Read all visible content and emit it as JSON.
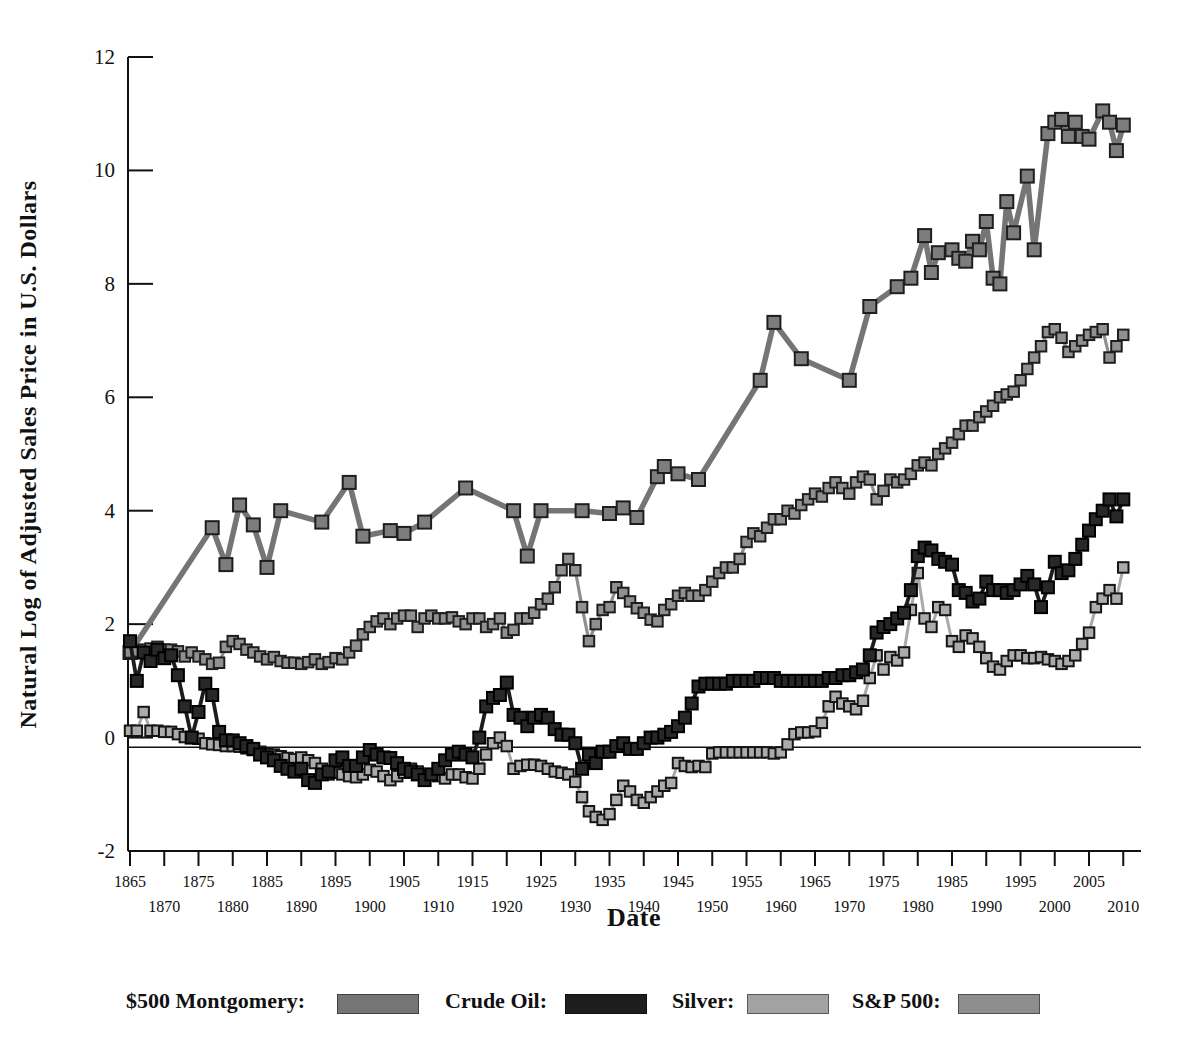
{
  "figure": {
    "y_axis": {
      "title": "Natural Log of Adjusted Sales Price in U.S. Dollars",
      "ticks": [
        12,
        10,
        8,
        6,
        4,
        2,
        0,
        -2
      ],
      "min": -2,
      "max": 12
    },
    "x_axis": {
      "title": "Date",
      "tick_years": [
        1865,
        1870,
        1875,
        1880,
        1885,
        1890,
        1895,
        1900,
        1905,
        1910,
        1915,
        1920,
        1925,
        1930,
        1935,
        1940,
        1945,
        1950,
        1955,
        1960,
        1965,
        1970,
        1975,
        1980,
        1985,
        1990,
        1995,
        2000,
        2005,
        2010
      ],
      "min": 1865,
      "max": 2010
    },
    "baseline_value": -0.17
  },
  "legend": {
    "items": [
      {
        "label": "$500 Montgomery:",
        "color": "#757575"
      },
      {
        "label": "Crude Oil:",
        "color": "#1d1d1d"
      },
      {
        "label": "Silver:",
        "color": "#a2a2a2"
      },
      {
        "label": "S&P 500:",
        "color": "#8e8e8e"
      }
    ]
  },
  "chart_data": {
    "type": "line",
    "title": "",
    "xlabel": "Date",
    "ylabel": "Natural Log of Adjusted Sales Price in U.S. Dollars",
    "xlim": [
      1863,
      2012
    ],
    "ylim": [
      -2,
      12
    ],
    "grid": false,
    "legend_position": "bottom",
    "series": [
      {
        "name": "$500 Montgomery",
        "line_color": "#757575",
        "marker_fill": "#7d7d7d",
        "marker_edge": "#1e1e1e",
        "line_width": 5.5,
        "marker_size": 13,
        "points": [
          [
            1865,
            1.5
          ],
          [
            1877,
            3.7
          ],
          [
            1879,
            3.05
          ],
          [
            1881,
            4.1
          ],
          [
            1883,
            3.75
          ],
          [
            1885,
            3.0
          ],
          [
            1887,
            4.0
          ],
          [
            1893,
            3.8
          ],
          [
            1897,
            4.5
          ],
          [
            1899,
            3.55
          ],
          [
            1903,
            3.65
          ],
          [
            1905,
            3.6
          ],
          [
            1908,
            3.8
          ],
          [
            1914,
            4.4
          ],
          [
            1921,
            4.0
          ],
          [
            1923,
            3.2
          ],
          [
            1925,
            4.0
          ],
          [
            1931,
            4.0
          ],
          [
            1935,
            3.95
          ],
          [
            1937,
            4.05
          ],
          [
            1939,
            3.88
          ],
          [
            1942,
            4.6
          ],
          [
            1943,
            4.78
          ],
          [
            1945,
            4.65
          ],
          [
            1948,
            4.55
          ],
          [
            1957,
            6.3
          ],
          [
            1959,
            7.32
          ],
          [
            1963,
            6.68
          ],
          [
            1970,
            6.3
          ],
          [
            1973,
            7.6
          ],
          [
            1977,
            7.95
          ],
          [
            1979,
            8.1
          ],
          [
            1981,
            8.85
          ],
          [
            1982,
            8.2
          ],
          [
            1983,
            8.55
          ],
          [
            1985,
            8.6
          ],
          [
            1986,
            8.45
          ],
          [
            1987,
            8.4
          ],
          [
            1988,
            8.75
          ],
          [
            1989,
            8.6
          ],
          [
            1990,
            9.1
          ],
          [
            1991,
            8.1
          ],
          [
            1992,
            8.0
          ],
          [
            1993,
            9.45
          ],
          [
            1994,
            8.9
          ],
          [
            1996,
            9.9
          ],
          [
            1997,
            8.6
          ],
          [
            1999,
            10.65
          ],
          [
            2000,
            10.85
          ],
          [
            2001,
            10.9
          ],
          [
            2002,
            10.6
          ],
          [
            2003,
            10.85
          ],
          [
            2004,
            10.6
          ],
          [
            2005,
            10.55
          ],
          [
            2007,
            11.05
          ],
          [
            2008,
            10.85
          ],
          [
            2009,
            10.35
          ],
          [
            2010,
            10.8
          ]
        ]
      },
      {
        "name": "S&P 500",
        "line_color": "#8f8f8f",
        "marker_fill": "#909090",
        "marker_edge": "#1e1e1e",
        "line_width": 3.2,
        "marker_size": 10.5,
        "start_year": 1865,
        "values": [
          1.5,
          1.52,
          1.55,
          1.57,
          1.6,
          1.55,
          1.55,
          1.52,
          1.43,
          1.5,
          1.43,
          1.38,
          1.3,
          1.32,
          1.6,
          1.7,
          1.65,
          1.55,
          1.5,
          1.43,
          1.38,
          1.42,
          1.35,
          1.32,
          1.32,
          1.3,
          1.33,
          1.38,
          1.3,
          1.33,
          1.4,
          1.38,
          1.5,
          1.62,
          1.82,
          1.95,
          2.05,
          2.1,
          2.0,
          2.1,
          2.15,
          2.15,
          1.95,
          2.1,
          2.15,
          2.1,
          2.1,
          2.12,
          2.05,
          2.0,
          2.1,
          2.1,
          1.95,
          2.0,
          2.1,
          1.85,
          1.9,
          2.1,
          2.1,
          2.2,
          2.35,
          2.45,
          2.65,
          2.95,
          3.15,
          2.95,
          2.3,
          1.7,
          2.0,
          2.25,
          2.3,
          2.65,
          2.55,
          2.4,
          2.28,
          2.2,
          2.08,
          2.05,
          2.25,
          2.35,
          2.5,
          2.55,
          2.5,
          2.5,
          2.6,
          2.75,
          2.9,
          3.0,
          3.0,
          3.15,
          3.45,
          3.6,
          3.55,
          3.7,
          3.85,
          3.85,
          4.0,
          3.95,
          4.1,
          4.2,
          4.3,
          4.25,
          4.4,
          4.5,
          4.4,
          4.3,
          4.5,
          4.6,
          4.55,
          4.2,
          4.35,
          4.55,
          4.5,
          4.55,
          4.65,
          4.8,
          4.85,
          4.8,
          5.0,
          5.1,
          5.2,
          5.35,
          5.5,
          5.5,
          5.65,
          5.75,
          5.85,
          6.0,
          6.05,
          6.1,
          6.3,
          6.5,
          6.7,
          6.9,
          7.15,
          7.2,
          7.05,
          6.8,
          6.9,
          7.0,
          7.1,
          7.15,
          7.2,
          6.7,
          6.9,
          7.1
        ]
      },
      {
        "name": "Silver",
        "line_color": "#a9a9a9",
        "marker_fill": "#ababab",
        "marker_edge": "#151515",
        "line_width": 3,
        "marker_size": 10.5,
        "start_year": 1865,
        "values": [
          0.12,
          0.12,
          0.45,
          0.12,
          0.12,
          0.1,
          0.1,
          0.06,
          0.01,
          0.0,
          -0.02,
          -0.1,
          -0.12,
          -0.13,
          -0.15,
          -0.15,
          -0.16,
          -0.19,
          -0.22,
          -0.25,
          -0.28,
          -0.3,
          -0.33,
          -0.36,
          -0.38,
          -0.35,
          -0.4,
          -0.45,
          -0.55,
          -0.65,
          -0.62,
          -0.65,
          -0.68,
          -0.7,
          -0.65,
          -0.57,
          -0.6,
          -0.68,
          -0.75,
          -0.68,
          -0.62,
          -0.55,
          -0.6,
          -0.68,
          -0.65,
          -0.68,
          -0.72,
          -0.65,
          -0.65,
          -0.7,
          -0.72,
          -0.55,
          -0.3,
          -0.1,
          0.0,
          -0.15,
          -0.55,
          -0.5,
          -0.48,
          -0.48,
          -0.5,
          -0.55,
          -0.6,
          -0.62,
          -0.65,
          -0.78,
          -1.05,
          -1.3,
          -1.4,
          -1.45,
          -1.35,
          -1.1,
          -0.85,
          -0.95,
          -1.1,
          -1.15,
          -1.05,
          -0.95,
          -0.85,
          -0.8,
          -0.45,
          -0.5,
          -0.52,
          -0.5,
          -0.52,
          -0.28,
          -0.26,
          -0.26,
          -0.26,
          -0.26,
          -0.26,
          -0.26,
          -0.26,
          -0.26,
          -0.28,
          -0.26,
          -0.12,
          0.06,
          0.09,
          0.09,
          0.11,
          0.26,
          0.55,
          0.72,
          0.6,
          0.55,
          0.5,
          0.65,
          1.05,
          1.45,
          1.2,
          1.42,
          1.36,
          1.5,
          2.25,
          2.9,
          2.1,
          1.95,
          2.3,
          2.25,
          1.7,
          1.6,
          1.8,
          1.75,
          1.6,
          1.4,
          1.25,
          1.2,
          1.35,
          1.45,
          1.45,
          1.4,
          1.4,
          1.42,
          1.38,
          1.35,
          1.3,
          1.35,
          1.45,
          1.65,
          1.85,
          2.3,
          2.45,
          2.6,
          2.45,
          3.0
        ]
      },
      {
        "name": "Crude Oil",
        "line_color": "#1c1c1c",
        "marker_fill": "#282828",
        "marker_edge": "#000000",
        "line_width": 3.8,
        "marker_size": 12,
        "start_year": 1865,
        "values": [
          1.7,
          1.0,
          1.5,
          1.35,
          1.55,
          1.4,
          1.45,
          1.1,
          0.55,
          0.0,
          0.45,
          0.95,
          0.75,
          0.1,
          -0.05,
          -0.05,
          -0.1,
          -0.15,
          -0.2,
          -0.3,
          -0.35,
          -0.4,
          -0.5,
          -0.55,
          -0.6,
          -0.55,
          -0.75,
          -0.8,
          -0.65,
          -0.6,
          -0.4,
          -0.35,
          -0.5,
          -0.5,
          -0.35,
          -0.22,
          -0.3,
          -0.35,
          -0.36,
          -0.45,
          -0.55,
          -0.6,
          -0.65,
          -0.75,
          -0.65,
          -0.55,
          -0.4,
          -0.3,
          -0.25,
          -0.3,
          -0.35,
          0.0,
          0.55,
          0.7,
          0.75,
          0.97,
          0.4,
          0.35,
          0.2,
          0.35,
          0.4,
          0.35,
          0.15,
          0.05,
          0.05,
          -0.1,
          -0.55,
          -0.3,
          -0.45,
          -0.25,
          -0.25,
          -0.15,
          -0.1,
          -0.2,
          -0.2,
          -0.1,
          0.0,
          0.0,
          0.05,
          0.1,
          0.2,
          0.35,
          0.6,
          0.9,
          0.95,
          0.95,
          0.95,
          0.95,
          1.0,
          1.0,
          1.0,
          1.0,
          1.05,
          1.05,
          1.05,
          1.0,
          1.0,
          1.0,
          1.0,
          1.0,
          1.0,
          1.0,
          1.05,
          1.05,
          1.1,
          1.1,
          1.15,
          1.2,
          1.45,
          1.85,
          1.95,
          2.0,
          2.1,
          2.2,
          2.6,
          3.2,
          3.35,
          3.3,
          3.15,
          3.1,
          3.05,
          2.6,
          2.55,
          2.4,
          2.45,
          2.75,
          2.6,
          2.6,
          2.55,
          2.6,
          2.7,
          2.85,
          2.7,
          2.3,
          2.65,
          3.1,
          2.9,
          2.95,
          3.15,
          3.4,
          3.65,
          3.85,
          4.0,
          4.2,
          3.9,
          4.2
        ]
      }
    ]
  }
}
